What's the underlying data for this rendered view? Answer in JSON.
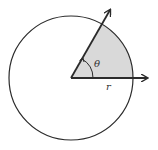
{
  "diagram": {
    "labels": {
      "angle": "θ",
      "radius": "r"
    },
    "colors": {
      "stroke": "#2b2b2b",
      "sector_fill": "#d9d9d9",
      "background": "#ffffff"
    },
    "geometry": {
      "center": [
        71,
        78
      ],
      "radius": 62,
      "angle_deg": 60
    }
  }
}
